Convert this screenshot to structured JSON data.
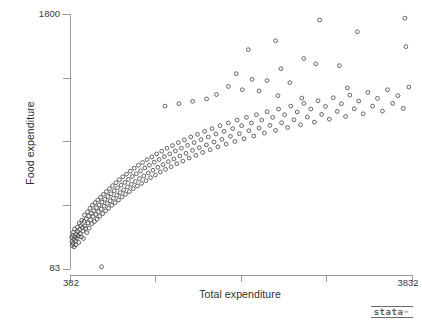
{
  "chart_data": {
    "type": "scatter",
    "title": "",
    "xlabel": "Total expenditure",
    "ylabel": "Food expenditure",
    "xlim": [
      382,
      3832
    ],
    "ylim": [
      83,
      1800
    ],
    "xticks": [
      382,
      3832
    ],
    "yticks": [
      83,
      1800
    ],
    "xtick_labels": [
      "382",
      "3832"
    ],
    "ytick_labels": [
      "83",
      "1800"
    ],
    "grid": false,
    "legend": null,
    "marker": "open-circle",
    "marker_color": "#4a4a4a",
    "axis_color": "#9a9a9a",
    "n_points": 235,
    "points": [
      [
        398,
        296
      ],
      [
        402,
        268
      ],
      [
        405,
        241
      ],
      [
        409,
        310
      ],
      [
        412,
        255
      ],
      [
        416,
        330
      ],
      [
        420,
        284
      ],
      [
        424,
        232
      ],
      [
        428,
        352
      ],
      [
        433,
        300
      ],
      [
        438,
        272
      ],
      [
        442,
        247
      ],
      [
        447,
        318
      ],
      [
        452,
        290
      ],
      [
        456,
        365
      ],
      [
        461,
        334
      ],
      [
        466,
        305
      ],
      [
        470,
        262
      ],
      [
        475,
        392
      ],
      [
        480,
        348
      ],
      [
        486,
        320
      ],
      [
        491,
        376
      ],
      [
        496,
        300
      ],
      [
        501,
        412
      ],
      [
        506,
        362
      ],
      [
        512,
        338
      ],
      [
        518,
        288
      ],
      [
        523,
        404
      ],
      [
        528,
        446
      ],
      [
        534,
        372
      ],
      [
        540,
        356
      ],
      [
        546,
        420
      ],
      [
        552,
        328
      ],
      [
        558,
        468
      ],
      [
        564,
        392
      ],
      [
        570,
        440
      ],
      [
        576,
        358
      ],
      [
        583,
        492
      ],
      [
        589,
        414
      ],
      [
        595,
        458
      ],
      [
        602,
        388
      ],
      [
        608,
        512
      ],
      [
        615,
        436
      ],
      [
        621,
        476
      ],
      [
        628,
        402
      ],
      [
        635,
        530
      ],
      [
        641,
        450
      ],
      [
        648,
        496
      ],
      [
        655,
        418
      ],
      [
        662,
        548
      ],
      [
        669,
        470
      ],
      [
        676,
        514
      ],
      [
        683,
        438
      ],
      [
        690,
        566
      ],
      [
        697,
        486
      ],
      [
        704,
        534
      ],
      [
        712,
        456
      ],
      [
        719,
        586
      ],
      [
        726,
        506
      ],
      [
        734,
        552
      ],
      [
        741,
        474
      ],
      [
        749,
        604
      ],
      [
        757,
        524
      ],
      [
        764,
        572
      ],
      [
        772,
        492
      ],
      [
        780,
        624
      ],
      [
        788,
        542
      ],
      [
        796,
        590
      ],
      [
        804,
        512
      ],
      [
        812,
        644
      ],
      [
        820,
        560
      ],
      [
        828,
        610
      ],
      [
        837,
        530
      ],
      [
        845,
        664
      ],
      [
        854,
        580
      ],
      [
        862,
        630
      ],
      [
        871,
        548
      ],
      [
        880,
        684
      ],
      [
        888,
        598
      ],
      [
        897,
        648
      ],
      [
        906,
        568
      ],
      [
        915,
        704
      ],
      [
        924,
        616
      ],
      [
        934,
        666
      ],
      [
        943,
        586
      ],
      [
        952,
        722
      ],
      [
        962,
        636
      ],
      [
        971,
        686
      ],
      [
        981,
        604
      ],
      [
        991,
        742
      ],
      [
        1000,
        654
      ],
      [
        1010,
        706
      ],
      [
        1020,
        624
      ],
      [
        1030,
        762
      ],
      [
        1041,
        672
      ],
      [
        1051,
        724
      ],
      [
        1061,
        642
      ],
      [
        1072,
        782
      ],
      [
        1083,
        692
      ],
      [
        1093,
        744
      ],
      [
        1104,
        660
      ],
      [
        1115,
        800
      ],
      [
        1126,
        710
      ],
      [
        1137,
        764
      ],
      [
        1149,
        678
      ],
      [
        1160,
        820
      ],
      [
        1172,
        730
      ],
      [
        1183,
        782
      ],
      [
        1195,
        698
      ],
      [
        1207,
        838
      ],
      [
        1219,
        748
      ],
      [
        1231,
        802
      ],
      [
        1243,
        716
      ],
      [
        1256,
        858
      ],
      [
        1268,
        768
      ],
      [
        1281,
        820
      ],
      [
        1294,
        736
      ],
      [
        1307,
        876
      ],
      [
        1320,
        786
      ],
      [
        1333,
        840
      ],
      [
        1346,
        754
      ],
      [
        1360,
        896
      ],
      [
        1374,
        806
      ],
      [
        1388,
        858
      ],
      [
        1402,
        772
      ],
      [
        1416,
        914
      ],
      [
        1430,
        824
      ],
      [
        1445,
        878
      ],
      [
        1460,
        792
      ],
      [
        1475,
        934
      ],
      [
        1490,
        844
      ],
      [
        1505,
        896
      ],
      [
        1520,
        810
      ],
      [
        1536,
        952
      ],
      [
        1552,
        862
      ],
      [
        1568,
        916
      ],
      [
        1584,
        830
      ],
      [
        1600,
        972
      ],
      [
        1617,
        882
      ],
      [
        1634,
        934
      ],
      [
        1651,
        848
      ],
      [
        1668,
        990
      ],
      [
        1686,
        900
      ],
      [
        1703,
        954
      ],
      [
        1721,
        868
      ],
      [
        1740,
        1010
      ],
      [
        1758,
        918
      ],
      [
        1777,
        972
      ],
      [
        1796,
        886
      ],
      [
        1815,
        1028
      ],
      [
        1835,
        938
      ],
      [
        1854,
        992
      ],
      [
        1874,
        906
      ],
      [
        1895,
        1048
      ],
      [
        1915,
        956
      ],
      [
        1936,
        1010
      ],
      [
        1957,
        924
      ],
      [
        1979,
        1066
      ],
      [
        2001,
        976
      ],
      [
        2023,
        1028
      ],
      [
        2045,
        942
      ],
      [
        2068,
        1086
      ],
      [
        2091,
        994
      ],
      [
        2114,
        1048
      ],
      [
        2138,
        960
      ],
      [
        2162,
        1104
      ],
      [
        2187,
        1014
      ],
      [
        2212,
        1066
      ],
      [
        2237,
        978
      ],
      [
        2263,
        1122
      ],
      [
        2289,
        1032
      ],
      [
        2316,
        1086
      ],
      [
        2343,
        998
      ],
      [
        2371,
        1142
      ],
      [
        2399,
        1050
      ],
      [
        2427,
        1104
      ],
      [
        2456,
        1016
      ],
      [
        2486,
        1160
      ],
      [
        2516,
        1068
      ],
      [
        2546,
        1122
      ],
      [
        2577,
        1036
      ],
      [
        2609,
        1180
      ],
      [
        2641,
        1088
      ],
      [
        2674,
        1140
      ],
      [
        2707,
        1054
      ],
      [
        2741,
        1198
      ],
      [
        2776,
        1106
      ],
      [
        2811,
        1160
      ],
      [
        2847,
        1072
      ],
      [
        2884,
        1216
      ],
      [
        2921,
        1124
      ],
      [
        2959,
        1178
      ],
      [
        2998,
        1092
      ],
      [
        3038,
        1236
      ],
      [
        3078,
        1144
      ],
      [
        3120,
        1196
      ],
      [
        3162,
        1110
      ],
      [
        3205,
        1254
      ],
      [
        3249,
        1162
      ],
      [
        3294,
        1214
      ],
      [
        3340,
        1128
      ],
      [
        3387,
        1272
      ],
      [
        3435,
        1180
      ],
      [
        3484,
        1232
      ],
      [
        3534,
        1146
      ],
      [
        3585,
        1290
      ],
      [
        3637,
        1198
      ],
      [
        3690,
        1250
      ],
      [
        3744,
        1164
      ],
      [
        3800,
        1308
      ],
      [
        2180,
        1560
      ],
      [
        2456,
        1620
      ],
      [
        2740,
        1500
      ],
      [
        2900,
        1760
      ],
      [
        3280,
        1680
      ],
      [
        3760,
        1772
      ],
      [
        3770,
        1580
      ],
      [
        2510,
        1432
      ],
      [
        2860,
        1464
      ],
      [
        3100,
        1452
      ],
      [
        2060,
        1398
      ],
      [
        2220,
        1360
      ],
      [
        2370,
        1352
      ],
      [
        2600,
        1338
      ],
      [
        3180,
        1302
      ],
      [
        1980,
        1312
      ],
      [
        2120,
        1290
      ],
      [
        2290,
        1282
      ],
      [
        1860,
        1258
      ],
      [
        2480,
        1250
      ],
      [
        1760,
        1228
      ],
      [
        1620,
        1212
      ],
      [
        1480,
        1196
      ],
      [
        1340,
        1180
      ],
      [
        2720,
        1234
      ],
      [
        700,
        98
      ]
    ]
  },
  "footer": {
    "logo_text": "stata",
    "logo_tm": "™"
  }
}
